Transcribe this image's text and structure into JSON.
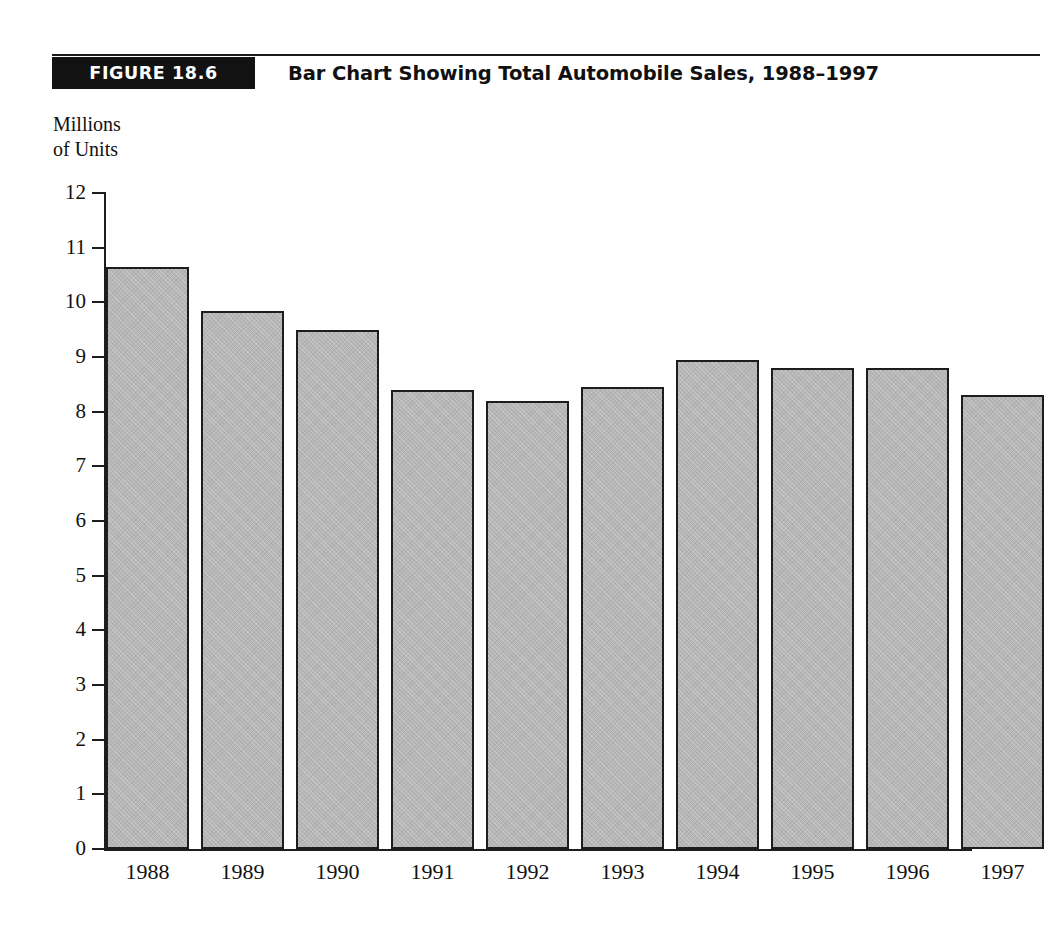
{
  "figure": {
    "badge_label": "FIGURE 18.6",
    "title": "Bar Chart Showing Total Automobile Sales, 1988–1997",
    "axis_caption_line1": "Millions",
    "axis_caption_line2": "of Units"
  },
  "colors": {
    "bar_fill": "#b6b6b6",
    "bar_border": "#1d1d1d",
    "badge_background": "#121212",
    "badge_text": "#ffffff",
    "axis": "#1d1d1d",
    "page_background": "#ffffff",
    "text": "#111111"
  },
  "chart_data": {
    "type": "bar",
    "title": "Bar Chart Showing Total Automobile Sales, 1988–1997",
    "xlabel": "",
    "ylabel": "Millions of Units",
    "categories": [
      "1988",
      "1989",
      "1990",
      "1991",
      "1992",
      "1993",
      "1994",
      "1995",
      "1996",
      "1997"
    ],
    "values": [
      10.65,
      9.85,
      9.5,
      8.4,
      8.2,
      8.45,
      8.95,
      8.8,
      8.8,
      8.3
    ],
    "ylim": [
      0,
      12
    ],
    "ytick_labels": [
      "12",
      "11",
      "10",
      "9",
      "8",
      "7",
      "6",
      "5",
      "4",
      "3",
      "2",
      "1",
      "0"
    ],
    "ytick_values": [
      12,
      11,
      10,
      9,
      8,
      7,
      6,
      5,
      4,
      3,
      2,
      1,
      0
    ],
    "ytick_step": 1,
    "grid": false,
    "legend": false,
    "legend_position": "none",
    "series": [
      {
        "name": "Total Automobile Sales",
        "values": [
          10.65,
          9.85,
          9.5,
          8.4,
          8.2,
          8.45,
          8.95,
          8.8,
          8.8,
          8.3
        ]
      }
    ]
  }
}
